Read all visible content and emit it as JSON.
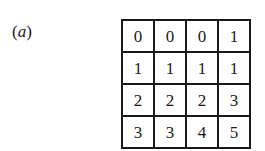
{
  "figure": {
    "label_open": "(",
    "label_letter": "a",
    "label_close": ")",
    "grid": {
      "rows": [
        [
          "0",
          "0",
          "0",
          "1"
        ],
        [
          "1",
          "1",
          "1",
          "1"
        ],
        [
          "2",
          "2",
          "2",
          "3"
        ],
        [
          "3",
          "3",
          "4",
          "5"
        ]
      ]
    }
  }
}
